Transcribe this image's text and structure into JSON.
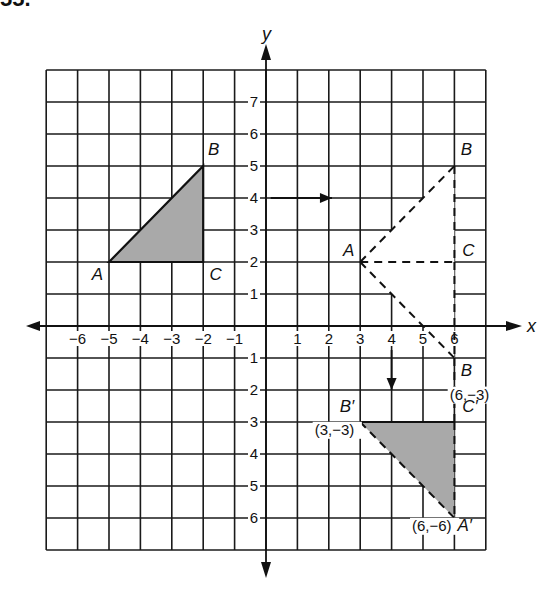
{
  "header": {
    "cut_off_text": "55."
  },
  "plot": {
    "origin_px": [
      266,
      326
    ],
    "unit_px": [
      31.4,
      32
    ],
    "grid": {
      "x_min": -7,
      "x_max": 7,
      "y_min": -7,
      "y_max": 8
    },
    "axes": {
      "x_label": "x",
      "y_label": "y",
      "x_ticks": [
        {
          "v": -6,
          "label": "−6"
        },
        {
          "v": -5,
          "label": "−5"
        },
        {
          "v": -4,
          "label": "−4"
        },
        {
          "v": -3,
          "label": "−3"
        },
        {
          "v": -2,
          "label": "−2"
        },
        {
          "v": -1,
          "label": "−1"
        },
        {
          "v": 1,
          "label": "1"
        },
        {
          "v": 2,
          "label": "2"
        },
        {
          "v": 3,
          "label": "3"
        },
        {
          "v": 4,
          "label": "4"
        },
        {
          "v": 5,
          "label": "5"
        },
        {
          "v": 6,
          "label": "6"
        }
      ],
      "y_ticks": [
        {
          "v": 7,
          "label": "7"
        },
        {
          "v": 6,
          "label": "6"
        },
        {
          "v": 5,
          "label": "5"
        },
        {
          "v": 4,
          "label": "4"
        },
        {
          "v": 3,
          "label": "3"
        },
        {
          "v": 2,
          "label": "2"
        },
        {
          "v": 1,
          "label": "1"
        },
        {
          "v": -1,
          "label": "1"
        },
        {
          "v": -2,
          "label": "2"
        },
        {
          "v": -3,
          "label": "3"
        },
        {
          "v": -4,
          "label": "4"
        },
        {
          "v": -5,
          "label": "5"
        },
        {
          "v": -6,
          "label": "6"
        }
      ]
    },
    "colors": {
      "grid": "#1a1a1a",
      "fill": "#a9a9a9",
      "background": "#ffffff"
    }
  },
  "figures": {
    "original_triangle": {
      "vertices": {
        "A": [
          -5,
          2
        ],
        "B": [
          -2,
          5
        ],
        "C": [
          -2,
          2
        ]
      },
      "labels": [
        {
          "text": "A",
          "at": [
            -5.55,
            1.45
          ]
        },
        {
          "text": "B",
          "at": [
            -1.85,
            5.35
          ]
        },
        {
          "text": "C",
          "at": [
            -1.8,
            1.45
          ]
        }
      ],
      "shaded": true
    },
    "translated_triangle": {
      "vertices": {
        "A": [
          3,
          2
        ],
        "B": [
          6,
          5
        ],
        "C": [
          6,
          2
        ]
      },
      "labels": [
        {
          "text": "A",
          "at": [
            2.45,
            2.2
          ]
        },
        {
          "text": "B",
          "at": [
            6.2,
            5.35
          ]
        },
        {
          "text": "C",
          "at": [
            6.25,
            2.2
          ]
        }
      ],
      "dashed": true
    },
    "reflected_triangle": {
      "vertices": {
        "A": [
          3,
          2
        ],
        "C": [
          6,
          2
        ],
        "B": [
          6,
          -1
        ]
      },
      "labels": [
        {
          "text": "B",
          "at": [
            6.2,
            -1.55
          ]
        },
        {
          "text": "(6,−3)",
          "at": [
            5.85,
            -2.3
          ]
        }
      ],
      "dashed": true
    },
    "image_triangle": {
      "vertices": {
        "B'": [
          3,
          -3
        ],
        "C'": [
          6,
          -3
        ],
        "A'": [
          6,
          -6
        ]
      },
      "labels": [
        {
          "text": "B′",
          "at": [
            2.35,
            -2.7
          ]
        },
        {
          "text": "(3,−3)",
          "at": [
            1.55,
            -3.4
          ]
        },
        {
          "text": "C′",
          "at": [
            6.25,
            -2.7
          ]
        },
        {
          "text": "(6,−6)",
          "at": [
            4.65,
            -6.4
          ]
        },
        {
          "text": "A′",
          "at": [
            6.1,
            -6.4
          ]
        }
      ],
      "shaded": true,
      "dashed": true
    }
  },
  "arrows": [
    {
      "name": "translation-arrow",
      "from": [
        0.15,
        4
      ],
      "to": [
        2.1,
        4
      ]
    },
    {
      "name": "reflection-arrow",
      "from": [
        4,
        -0.75
      ],
      "to": [
        4,
        -2
      ]
    }
  ],
  "white_region": [
    [
      3,
      2
    ],
    [
      6,
      5
    ],
    [
      6,
      -1
    ]
  ]
}
